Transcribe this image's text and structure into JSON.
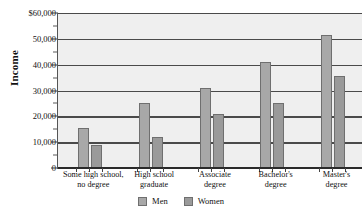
{
  "chart_data": {
    "type": "bar",
    "title": "",
    "subtitle": "",
    "xlabel": "",
    "ylabel": "Income",
    "ylim": [
      0,
      60000
    ],
    "ytick_values": [
      0,
      10000,
      20000,
      30000,
      40000,
      50000,
      60000
    ],
    "ytick_labels": [
      "0",
      "10,000",
      "20,000",
      "30,000",
      "40,000",
      "50,000",
      "$60,000"
    ],
    "yminor_tick_values": [
      5000,
      15000,
      25000,
      35000,
      45000,
      55000
    ],
    "grid": "horizontal",
    "legend_position": "bottom-center",
    "categories": [
      "Some high school, no degree",
      "High school graduate",
      "Associate degree",
      "Bachelor's degree",
      "Master's degree"
    ],
    "category_lines": [
      [
        "Some high school,",
        "no degree"
      ],
      [
        "High school",
        "graduate"
      ],
      [
        "Associate",
        "degree"
      ],
      [
        "Bachelor's",
        "degree"
      ],
      [
        "Master's",
        "degree"
      ]
    ],
    "series": [
      {
        "name": "Men",
        "color": "#a8a8a8",
        "values": [
          15500,
          25000,
          31000,
          41000,
          51500
        ]
      },
      {
        "name": "Women",
        "color": "#9a9a9a",
        "values": [
          9000,
          12000,
          21000,
          25000,
          35500
        ]
      }
    ]
  },
  "legend": {
    "items": [
      {
        "label": "Men",
        "swatch": "men"
      },
      {
        "label": "Women",
        "swatch": "women"
      }
    ]
  },
  "colors": {
    "plot_background": "#efefef",
    "gridline": "#4a4a4a",
    "men_bar": "#a8a8a8",
    "women_bar": "#9a9a9a",
    "text": "#111111"
  }
}
